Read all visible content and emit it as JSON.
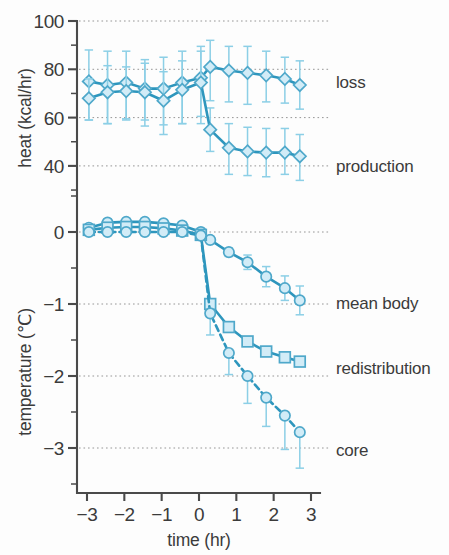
{
  "figure": {
    "background": "#fdfdfd",
    "accent_line": "#2e96bd",
    "accent_marker_fill": "#d2ecf7",
    "accent_errorbar": "#8ccfe6"
  },
  "axes": {
    "x": {
      "label": "time  (hr)",
      "ticks": [
        -3,
        -2,
        -1,
        0,
        1,
        2,
        3
      ],
      "tick_labels": [
        "−3",
        "−2",
        "−1",
        "0",
        "1",
        "2",
        "3"
      ],
      "range": [
        -3.25,
        3.25
      ]
    },
    "y_top": {
      "label": "heat  (kcal/hr)",
      "ticks": [
        100,
        80,
        60,
        40
      ],
      "tick_labels": [
        "100",
        "80",
        "60",
        "40"
      ],
      "range": [
        30,
        100
      ]
    },
    "y_bottom": {
      "label": "temperature  (℃)",
      "ticks": [
        0,
        -1,
        -2,
        -3
      ],
      "tick_labels": [
        "0",
        "−1",
        "−2",
        "−3"
      ],
      "range": [
        -3.45,
        0.45
      ]
    }
  },
  "series_labels": {
    "loss": "loss",
    "production": "production",
    "mean_body": "mean body",
    "redistribution": "redistribution",
    "core": "core"
  },
  "chart_data": {
    "type": "line",
    "title": "",
    "xlabel": "time (hr)",
    "ylabel": "heat (kcal/hr) / temperature (℃)",
    "grid": true,
    "legend": "inline-right-labels",
    "panels": [
      {
        "name": "heat",
        "ylabel": "heat (kcal/hr)",
        "ylim": [
          30,
          100
        ],
        "yticks": [
          40,
          60,
          80,
          100
        ],
        "series": [
          {
            "name": "loss",
            "marker": "diamond",
            "linestyle": "solid",
            "x": [
              -2.95,
              -2.45,
              -1.95,
              -1.45,
              -0.95,
              -0.45,
              0.05,
              0.3,
              0.8,
              1.3,
              1.8,
              2.3,
              2.7
            ],
            "y": [
              75.0,
              73.5,
              74.5,
              72.0,
              72.0,
              74.5,
              76.5,
              81.0,
              79.5,
              78.5,
              77.5,
              76.0,
              73.5
            ],
            "yerr_low": [
              16,
              16,
              15,
              13,
              15,
              17,
              16,
              14,
              13,
              13,
              11,
              10,
              10
            ],
            "yerr_high": [
              13,
              14,
              13,
              12,
              13,
              13,
              13,
              11,
              10,
              11,
              10,
              9,
              10
            ]
          },
          {
            "name": "production",
            "marker": "diamond",
            "linestyle": "solid",
            "x": [
              -2.95,
              -2.45,
              -1.95,
              -1.45,
              -0.95,
              -0.45,
              0.05,
              0.3,
              0.8,
              1.3,
              1.8,
              2.3,
              2.7
            ],
            "y": [
              68.0,
              70.5,
              71.0,
              70.5,
              67.0,
              71.5,
              74.5,
              55.0,
              47.5,
              46.0,
              45.5,
              45.5,
              44.0
            ],
            "yerr_low": [
              9,
              13,
              12,
              14,
              14,
              14,
              17,
              9,
              11,
              10,
              10,
              9,
              10
            ],
            "yerr_high": [
              8,
              11,
              10,
              12,
              12,
              12,
              13,
              9,
              10,
              10,
              10,
              10,
              9
            ]
          }
        ]
      },
      {
        "name": "temperature",
        "ylabel": "temperature (℃)",
        "ylim": [
          -3.45,
          0.45
        ],
        "yticks": [
          -3,
          -2,
          -1,
          0
        ],
        "series": [
          {
            "name": "mean body",
            "marker": "circle",
            "linestyle": "solid",
            "x": [
              -2.95,
              -2.45,
              -1.95,
              -1.45,
              -0.95,
              -0.45,
              0.05,
              0.3,
              0.8,
              1.3,
              1.8,
              2.3,
              2.7
            ],
            "y": [
              0.06,
              0.13,
              0.14,
              0.14,
              0.12,
              0.09,
              0.0,
              -0.11,
              -0.28,
              -0.42,
              -0.62,
              -0.78,
              -0.95
            ],
            "yerr_low": [
              0.04,
              0.05,
              0.05,
              0.05,
              0.05,
              0.05,
              0.05,
              0.05,
              0.06,
              0.1,
              0.14,
              0.17,
              0.2
            ],
            "yerr_high": [
              0.04,
              0.05,
              0.05,
              0.05,
              0.05,
              0.05,
              0.05,
              0.05,
              0.06,
              0.1,
              0.14,
              0.17,
              0.2
            ]
          },
          {
            "name": "redistribution",
            "marker": "square",
            "linestyle": "solid",
            "x": [
              -2.95,
              -2.45,
              -1.95,
              -1.45,
              -0.95,
              -0.45,
              0.05,
              0.3,
              0.8,
              1.3,
              1.8,
              2.3,
              2.7
            ],
            "y": [
              0.03,
              0.06,
              0.07,
              0.07,
              0.05,
              0.02,
              -0.04,
              -1.0,
              -1.32,
              -1.52,
              -1.66,
              -1.74,
              -1.8
            ],
            "yerr_low": [
              0.03,
              0.03,
              0.03,
              0.03,
              0.03,
              0.03,
              0.03,
              0.0,
              0.0,
              0.0,
              0.0,
              0.0,
              0.0
            ],
            "yerr_high": [
              0.03,
              0.03,
              0.03,
              0.03,
              0.03,
              0.03,
              0.03,
              0.0,
              0.0,
              0.0,
              0.0,
              0.0,
              0.0
            ]
          },
          {
            "name": "core",
            "marker": "circle",
            "linestyle": "dashed",
            "x": [
              -2.95,
              -2.45,
              -1.95,
              -1.45,
              -0.95,
              -0.45,
              0.05,
              0.3,
              0.8,
              1.3,
              1.8,
              2.3,
              2.7
            ],
            "y": [
              0.0,
              0.0,
              0.0,
              0.0,
              0.0,
              0.0,
              -0.05,
              -1.13,
              -1.68,
              -2.0,
              -2.3,
              -2.55,
              -2.78
            ],
            "yerr_low": [
              0.0,
              0.0,
              0.0,
              0.0,
              0.0,
              0.0,
              0.0,
              0.3,
              0.3,
              0.38,
              0.4,
              0.47,
              0.5
            ],
            "yerr_high": [
              0.0,
              0.0,
              0.0,
              0.0,
              0.0,
              0.0,
              0.0,
              0.0,
              0.0,
              0.0,
              0.0,
              0.0,
              0.0
            ]
          }
        ]
      }
    ]
  }
}
